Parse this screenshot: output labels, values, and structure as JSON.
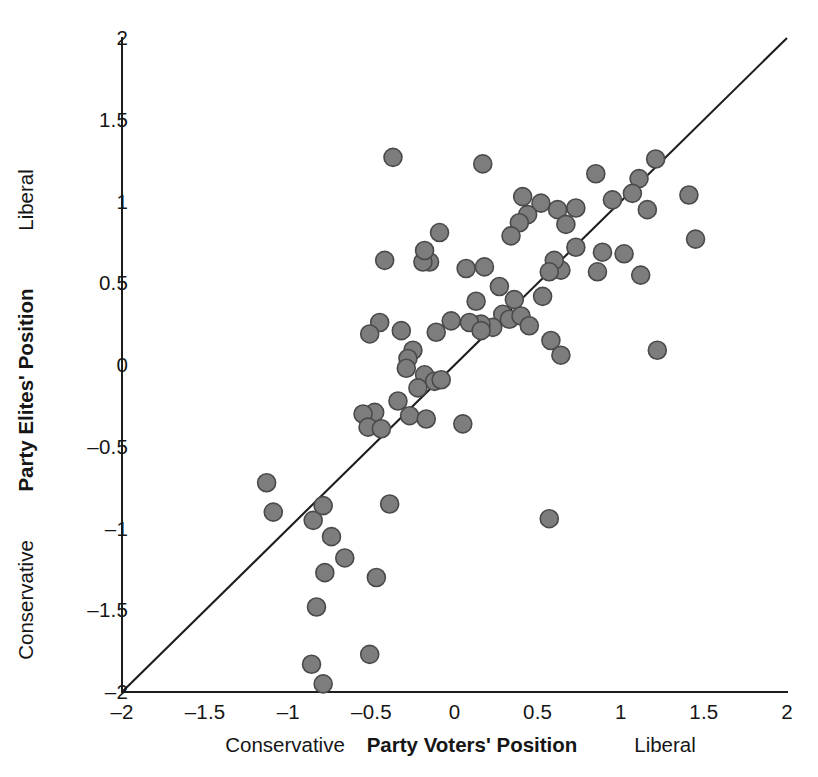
{
  "chart_data": {
    "type": "scatter",
    "title": "",
    "xlabel": "Party Voters' Position",
    "ylabel": "Party Elites' Position",
    "xlim": [
      -2,
      2
    ],
    "ylim": [
      -2,
      2
    ],
    "grid": false,
    "legend": "none",
    "x_ticks": [
      "-2",
      "-1.5",
      "-1",
      "-0.5",
      "0",
      "0.5",
      "1",
      "1.5",
      "2"
    ],
    "x_tick_values": [
      -2,
      -1.5,
      -1,
      -0.5,
      0,
      0.5,
      1,
      1.5,
      2
    ],
    "y_ticks": [
      "-2",
      "-1.5",
      "-1",
      "-0.5",
      "0",
      "0.5",
      "1",
      "1.5",
      "2"
    ],
    "y_tick_values": [
      -2,
      -1.5,
      -1,
      -0.5,
      0,
      0.5,
      1,
      1.5,
      2
    ],
    "x_axis_low_label": "Conservative",
    "x_axis_high_label": "Liberal",
    "y_axis_low_label": "Conservative",
    "y_axis_high_label": "Liberal",
    "marker": {
      "shape": "circle",
      "radius_px": 9,
      "fill": "#7d7d7d",
      "stroke": "#4a4a4a"
    },
    "reference_line": {
      "label": "45-degree line",
      "from": [
        -2,
        -2
      ],
      "to": [
        2,
        2
      ],
      "color": "#1d1d1d"
    },
    "points": [
      [
        -0.37,
        1.27
      ],
      [
        0.17,
        1.23
      ],
      [
        0.85,
        1.17
      ],
      [
        1.11,
        1.14
      ],
      [
        1.21,
        1.26
      ],
      [
        1.07,
        1.05
      ],
      [
        0.73,
        0.96
      ],
      [
        0.52,
        0.99
      ],
      [
        0.44,
        0.92
      ],
      [
        0.41,
        1.03
      ],
      [
        0.39,
        0.87
      ],
      [
        0.34,
        0.79
      ],
      [
        0.62,
        0.95
      ],
      [
        0.67,
        0.86
      ],
      [
        0.95,
        1.01
      ],
      [
        1.16,
        0.95
      ],
      [
        1.41,
        1.04
      ],
      [
        1.45,
        0.77
      ],
      [
        1.02,
        0.68
      ],
      [
        0.89,
        0.69
      ],
      [
        0.73,
        0.72
      ],
      [
        0.64,
        0.58
      ],
      [
        0.6,
        0.64
      ],
      [
        -0.09,
        0.81
      ],
      [
        -0.15,
        0.63
      ],
      [
        -0.19,
        0.63
      ],
      [
        -0.18,
        0.7
      ],
      [
        -0.42,
        0.64
      ],
      [
        0.07,
        0.59
      ],
      [
        0.18,
        0.6
      ],
      [
        0.27,
        0.48
      ],
      [
        0.13,
        0.39
      ],
      [
        0.36,
        0.4
      ],
      [
        0.53,
        0.42
      ],
      [
        0.57,
        0.57
      ],
      [
        0.86,
        0.57
      ],
      [
        1.22,
        0.09
      ],
      [
        1.12,
        0.55
      ],
      [
        0.29,
        0.31
      ],
      [
        0.33,
        0.28
      ],
      [
        0.4,
        0.3
      ],
      [
        0.23,
        0.23
      ],
      [
        0.16,
        0.25
      ],
      [
        0.09,
        0.26
      ],
      [
        -0.02,
        0.27
      ],
      [
        -0.11,
        0.2
      ],
      [
        -0.32,
        0.21
      ],
      [
        -0.45,
        0.26
      ],
      [
        -0.51,
        0.19
      ],
      [
        0.45,
        0.24
      ],
      [
        0.58,
        0.15
      ],
      [
        0.64,
        0.06
      ],
      [
        0.16,
        0.21
      ],
      [
        -0.25,
        0.09
      ],
      [
        -0.28,
        0.04
      ],
      [
        -0.29,
        -0.02
      ],
      [
        -0.18,
        -0.06
      ],
      [
        -0.12,
        -0.1
      ],
      [
        -0.08,
        -0.09
      ],
      [
        -0.22,
        -0.14
      ],
      [
        -0.34,
        -0.22
      ],
      [
        -0.27,
        -0.31
      ],
      [
        -0.17,
        -0.33
      ],
      [
        0.05,
        -0.36
      ],
      [
        -0.48,
        -0.29
      ],
      [
        -0.55,
        -0.3
      ],
      [
        -0.52,
        -0.38
      ],
      [
        -0.44,
        -0.39
      ],
      [
        -1.13,
        -0.72
      ],
      [
        -1.09,
        -0.9
      ],
      [
        -0.85,
        -0.95
      ],
      [
        -0.79,
        -0.86
      ],
      [
        -0.74,
        -1.05
      ],
      [
        -0.39,
        -0.85
      ],
      [
        0.57,
        -0.94
      ],
      [
        -0.66,
        -1.18
      ],
      [
        -0.78,
        -1.27
      ],
      [
        -0.47,
        -1.3
      ],
      [
        -0.83,
        -1.48
      ],
      [
        -0.86,
        -1.83
      ],
      [
        -0.79,
        -1.95
      ],
      [
        -0.51,
        -1.77
      ]
    ]
  }
}
